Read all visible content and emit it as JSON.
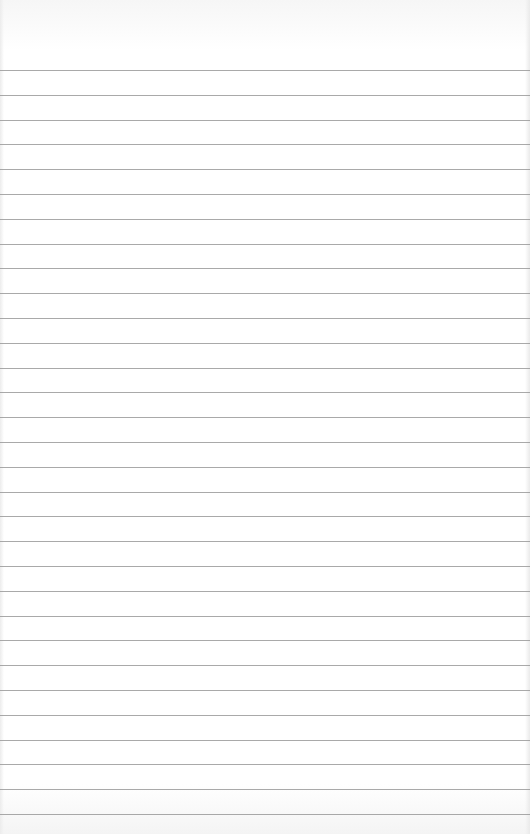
{
  "paper": {
    "type": "lined-paper",
    "background_color": "#ffffff",
    "rule_color": "#9a9a9a",
    "rule_count": 31,
    "first_rule_y": 70,
    "rule_spacing": 24.8
  }
}
